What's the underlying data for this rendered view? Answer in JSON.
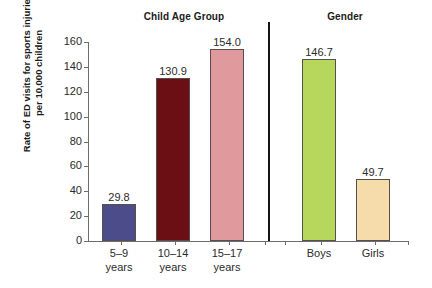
{
  "chart_data": {
    "type": "bar",
    "title": "",
    "xlabel": "",
    "ylabel": "Rate of ED visits for sports injuries\nper 10,000 children",
    "ylim": [
      0,
      160
    ],
    "ytick_values": [
      0,
      20,
      40,
      60,
      80,
      100,
      120,
      140,
      160
    ],
    "ytick_labels": [
      "0",
      "20",
      "40",
      "60",
      "80",
      "100",
      "120",
      "140",
      "160"
    ],
    "grid": false,
    "legend": "none",
    "panels": [
      {
        "name": "age-group",
        "title": "Child Age Group",
        "categories": [
          "5–9\nyears",
          "10–14\nyears",
          "15–17\nyears"
        ],
        "values": [
          29.8,
          130.9,
          154.0
        ],
        "value_labels": [
          "29.8",
          "130.9",
          "154.0"
        ],
        "colors": [
          "#4c4c8a",
          "#6b0f15",
          "#e09a9e"
        ]
      },
      {
        "name": "gender",
        "title": "Gender",
        "categories": [
          "Boys",
          "Girls"
        ],
        "values": [
          146.7,
          49.7
        ],
        "value_labels": [
          "146.7",
          "49.7"
        ],
        "colors": [
          "#b6d75c",
          "#f6dbab"
        ]
      }
    ]
  },
  "style": {
    "axis_color": "#6d6d6d",
    "divider_color": "#141414",
    "bar_border_color": "#55504e",
    "background": "#ffffff",
    "text_color": "#2b2b2b"
  }
}
